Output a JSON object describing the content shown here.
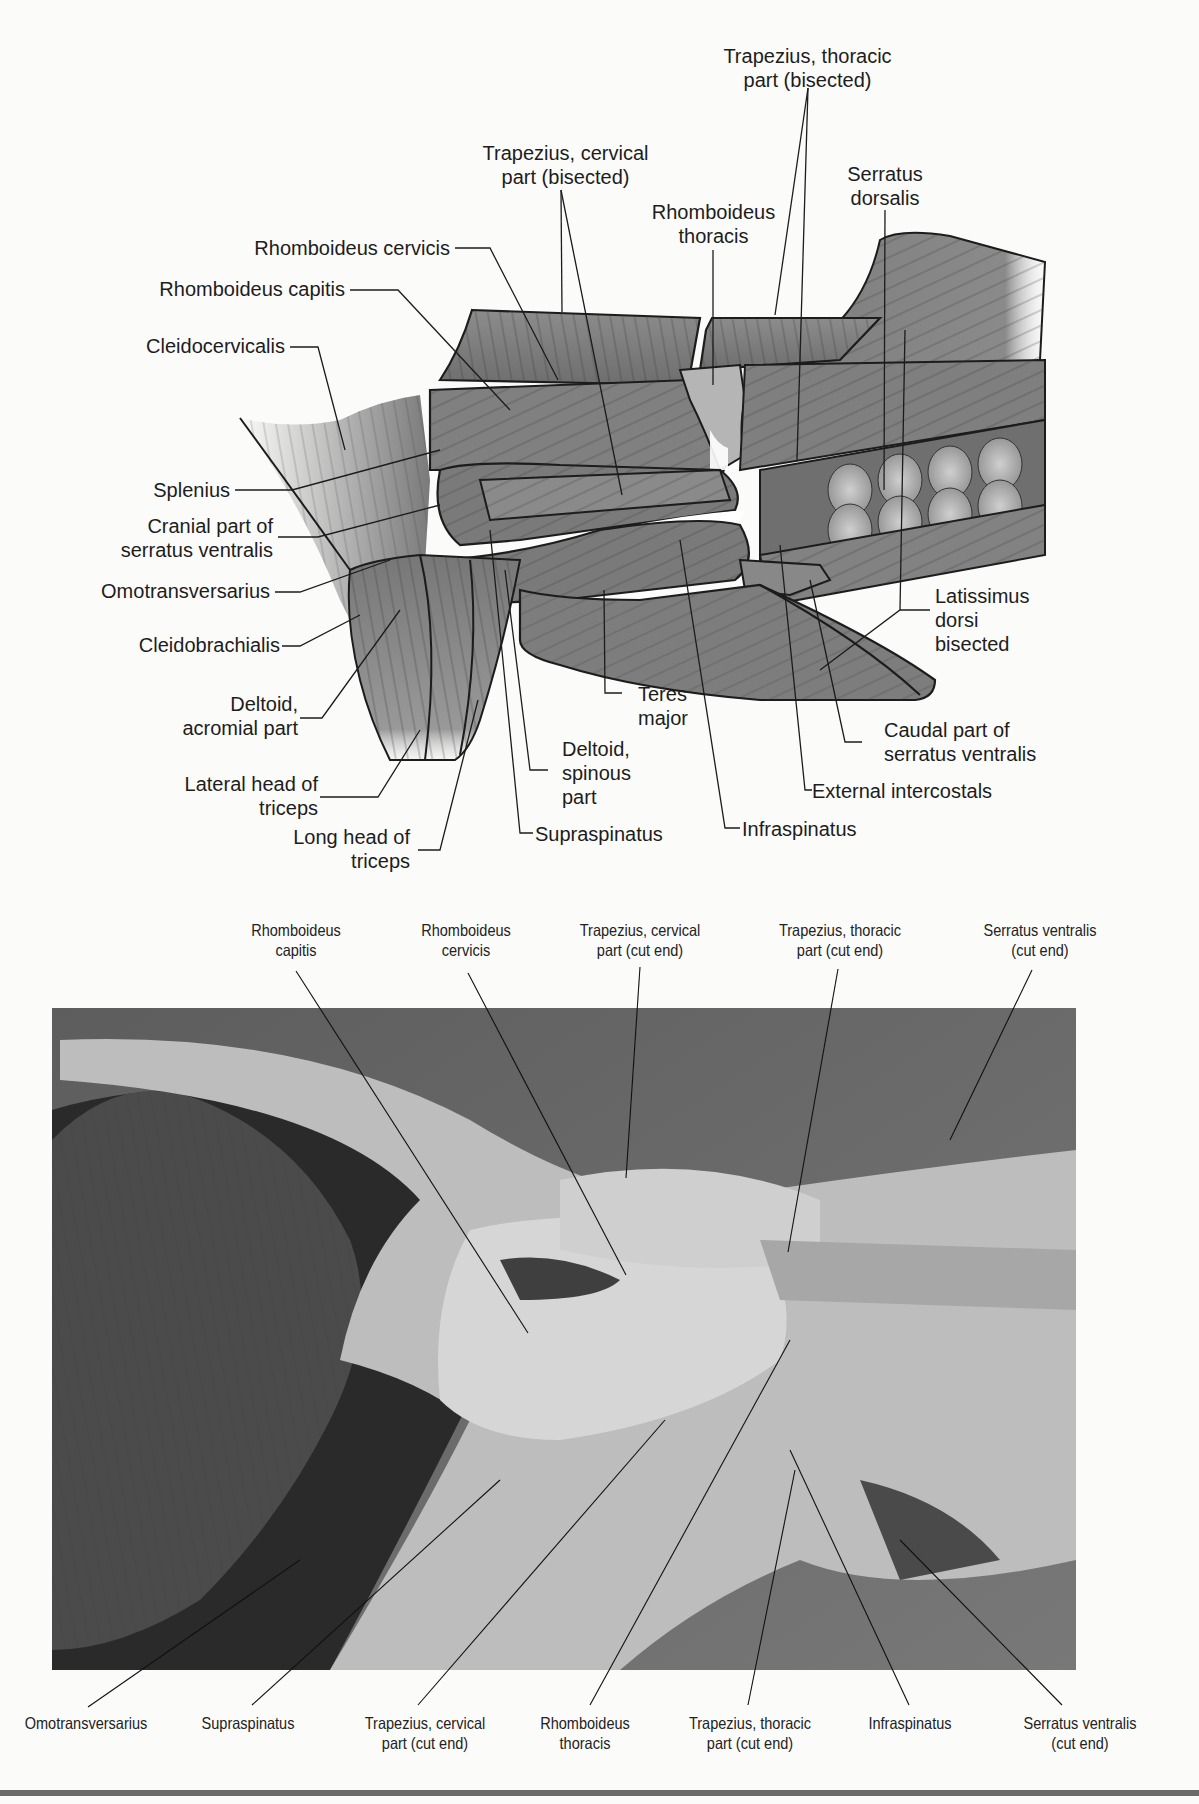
{
  "illustration": {
    "type": "anatomical-drawing",
    "view": "lateral view, superficial shoulder and back musculature (cat)",
    "labels": {
      "trapezius_thoracic_bisected": "Trapezius, thoracic\npart (bisected)",
      "trapezius_cervical_bisected": "Trapezius, cervical\npart (bisected)",
      "serratus_dorsalis": "Serratus\ndorsalis",
      "rhomboideus_thoracis": "Rhomboideus\nthoracis",
      "rhomboideus_cervicis": "Rhomboideus cervicis",
      "rhomboideus_capitis": "Rhomboideus capitis",
      "cleidocervicalis": "Cleidocervicalis",
      "splenius": "Splenius",
      "cranial_serratus_ventralis": "Cranial part of\nserratus ventralis",
      "omotransversarius": "Omotransversarius",
      "cleidobrachialis": "Cleidobrachialis",
      "deltoid_acromial": "Deltoid,\nacromial part",
      "lateral_head_triceps": "Lateral head of\ntriceps",
      "long_head_triceps": "Long head of\ntriceps",
      "teres_major": "Teres\nmajor",
      "deltoid_spinous": "Deltoid,\nspinous\npart",
      "supraspinatus": "Supraspinatus",
      "infraspinatus": "Infraspinatus",
      "latissimus_dorsi_bisected": "Latissimus\ndorsi\nbisected",
      "caudal_serratus_ventralis": "Caudal part of\nserratus ventralis",
      "external_intercostals": "External intercostals"
    }
  },
  "photograph": {
    "type": "dissection-photo",
    "top_labels": [
      "Rhomboideus\ncapitis",
      "Rhomboideus\ncervicis",
      "Trapezius, cervical\npart (cut end)",
      "Trapezius, thoracic\npart (cut end)",
      "Serratus ventralis\n(cut end)"
    ],
    "bottom_labels": [
      "Omotransversarius",
      "Supraspinatus",
      "Trapezius, cervical\npart (cut end)",
      "Rhomboideus\nthoracis",
      "Trapezius, thoracic\npart (cut end)",
      "Infraspinatus",
      "Serratus ventralis\n(cut end)"
    ]
  },
  "colors": {
    "muscle_fill": "#7d7d7d",
    "muscle_light": "#a9a9a9",
    "outline": "#1c1c1c",
    "photo_bg": "#6e6e6e",
    "page": "#fbfbfa"
  }
}
